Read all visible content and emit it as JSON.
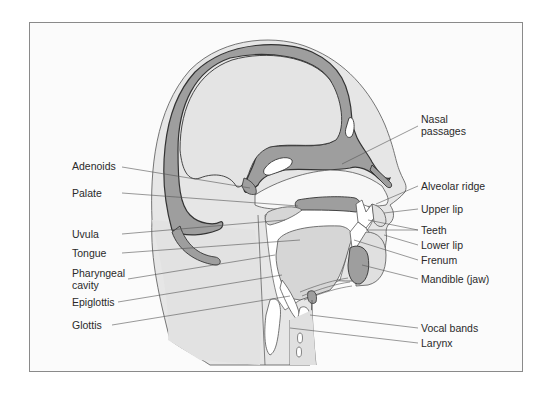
{
  "diagram": {
    "colors": {
      "background": "#fbfbfb",
      "tissue_light": "#e4e4e4",
      "tissue_mid": "#d3d3d3",
      "bone": "#9e9e9e",
      "outline": "#3a3a3a",
      "leader_line": "#555555",
      "cavity": "#ffffff"
    },
    "labels_left": [
      {
        "id": "adenoids",
        "text": "Adenoids"
      },
      {
        "id": "palate",
        "text": "Palate"
      },
      {
        "id": "uvula",
        "text": "Uvula"
      },
      {
        "id": "tongue",
        "text": "Tongue"
      },
      {
        "id": "pharyngeal-cavity",
        "text": "Pharyngeal",
        "text2": "cavity"
      },
      {
        "id": "epiglottis",
        "text": "Epiglottis"
      },
      {
        "id": "glottis",
        "text": "Glottis"
      }
    ],
    "labels_right": [
      {
        "id": "nasal-passages",
        "text": "Nasal",
        "text2": "passages"
      },
      {
        "id": "alveolar-ridge",
        "text": "Alveolar ridge"
      },
      {
        "id": "upper-lip",
        "text": "Upper lip"
      },
      {
        "id": "teeth",
        "text": "Teeth"
      },
      {
        "id": "lower-lip",
        "text": "Lower lip"
      },
      {
        "id": "frenum",
        "text": "Frenum"
      },
      {
        "id": "mandible",
        "text": "Mandible (jaw)"
      },
      {
        "id": "vocal-bands",
        "text": "Vocal bands"
      },
      {
        "id": "larynx",
        "text": "Larynx"
      }
    ]
  }
}
